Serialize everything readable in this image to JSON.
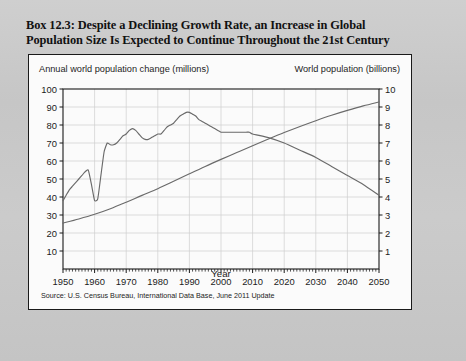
{
  "figure": {
    "title_line1": "Box 12.3: Despite a Declining Growth Rate, an Increase in Global",
    "title_line2": "Population Size Is Expected to Continue Throughout the 21st Century",
    "source_note": "Source: U.S. Census Bureau, International Data Base, June 2011 Update"
  },
  "chart_data": {
    "type": "line",
    "title": "",
    "xlabel": "Year",
    "ylabel": "Annual world population change (millions)",
    "y2label": "World population (billions)",
    "xlim": [
      1950,
      2050
    ],
    "ylim": [
      0,
      100
    ],
    "y2lim": [
      0,
      10
    ],
    "xticks": [
      "1950",
      "1960",
      "1970",
      "1980",
      "1990",
      "2000",
      "2010",
      "2020",
      "2030",
      "2040",
      "2050"
    ],
    "yticks": [
      "10",
      "20",
      "30",
      "40",
      "50",
      "60",
      "70",
      "80",
      "90",
      "100"
    ],
    "y2ticks": [
      "1",
      "2",
      "3",
      "4",
      "5",
      "6",
      "7",
      "8",
      "9",
      "10"
    ],
    "grid": true,
    "legend": "none",
    "line_color": "#6a6a6a",
    "axis_color": "#1a1a1a",
    "grid_color": "#cfcfcf",
    "series": [
      {
        "name": "Annual world population change (millions)",
        "axis": "left",
        "units": "millions per year",
        "x": [
          1950,
          1951,
          1952,
          1953,
          1954,
          1955,
          1956,
          1957,
          1958,
          1959,
          1960,
          1961,
          1962,
          1963,
          1964,
          1965,
          1966,
          1967,
          1968,
          1969,
          1970,
          1971,
          1972,
          1973,
          1974,
          1975,
          1976,
          1977,
          1978,
          1979,
          1980,
          1981,
          1982,
          1983,
          1984,
          1985,
          1986,
          1987,
          1988,
          1989,
          1990,
          1991,
          1992,
          1993,
          1994,
          1995,
          1996,
          1997,
          1998,
          1999,
          2000,
          2001,
          2002,
          2003,
          2004,
          2005,
          2006,
          2007,
          2008,
          2009,
          2010,
          2015,
          2020,
          2025,
          2030,
          2035,
          2040,
          2045,
          2050
        ],
        "values": [
          38,
          41,
          44,
          46,
          48,
          50,
          52,
          54,
          55,
          47,
          38,
          39,
          52,
          65,
          70,
          69,
          69,
          70,
          72,
          74,
          75,
          77,
          78,
          77,
          75,
          73,
          72,
          72,
          73,
          74,
          75,
          75,
          77,
          79,
          80,
          81,
          83,
          85,
          86,
          87,
          87,
          86,
          85,
          83,
          82,
          81,
          80,
          79,
          78,
          77,
          76,
          76,
          76,
          76,
          76,
          76,
          76,
          76,
          76,
          76,
          75,
          73,
          70,
          66,
          62,
          57,
          52,
          47,
          41
        ]
      },
      {
        "name": "World population (billions)",
        "axis": "right",
        "units": "billions",
        "x": [
          1950,
          1955,
          1960,
          1965,
          1970,
          1975,
          1980,
          1985,
          1990,
          1995,
          2000,
          2005,
          2010,
          2015,
          2020,
          2025,
          2030,
          2035,
          2040,
          2045,
          2050
        ],
        "values": [
          2.55,
          2.78,
          3.04,
          3.35,
          3.71,
          4.09,
          4.46,
          4.87,
          5.29,
          5.7,
          6.09,
          6.47,
          6.85,
          7.22,
          7.58,
          7.92,
          8.24,
          8.54,
          8.81,
          9.06,
          9.28
        ]
      }
    ],
    "annotations": [
      "Annual change dips sharply near 1960 and peaks near 1989 at about 87 million.",
      "The two curves cross at about 2016."
    ]
  }
}
